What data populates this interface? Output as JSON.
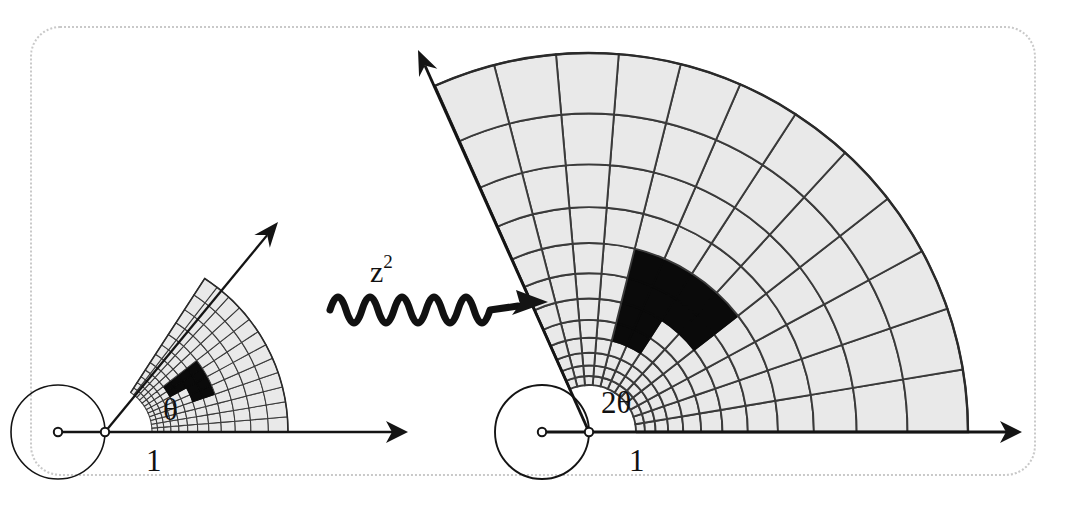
{
  "figure": {
    "background": "#ffffff",
    "frame": {
      "style": "dotted-rounded",
      "color": "#c9c9c9"
    },
    "colors": {
      "grid_fill": "#e9e9e9",
      "grid_stroke": "#3a3a3a",
      "shape_fill": "#0a0a0a",
      "axis": "#141414"
    }
  },
  "mapping": {
    "label_base": "z",
    "label_exponent": "2",
    "label_full": "z²",
    "arrow": "squiggly-right-arrow"
  },
  "domain_panel": {
    "name": "domain",
    "origin": [
      105,
      432
    ],
    "unit_radius": 47,
    "angle_label": "θ",
    "angle_degrees": 57,
    "unit_point_label": "1",
    "axis_arrow_tip": [
      408,
      432
    ],
    "ray_arrow_tip": [
      278,
      222
    ],
    "sector_outer_radius": 183,
    "radial_rings": 12,
    "angular_divisions": 12
  },
  "range_panel": {
    "name": "range",
    "origin": [
      589,
      432
    ],
    "unit_radius": 47,
    "angle_label": "2θ",
    "angle_degrees": 114,
    "unit_point_label": "1",
    "axis_arrow_tip": [
      1022,
      432
    ],
    "ray_arrow_tip": [
      418,
      50
    ],
    "sector_outer_radius": 379,
    "radial_rings": 6,
    "angular_divisions": 6
  },
  "chart_data": {
    "type": "diagram",
    "annotations": [
      "θ",
      "1",
      "z²",
      "2θ",
      "1"
    ],
    "domain_sector": {
      "r_min": 1.0,
      "r_max": 1.97,
      "theta_min_deg": 0,
      "theta_max_deg": 57,
      "radial_steps": 12,
      "angular_steps": 12,
      "radial_spacing": "geometric",
      "angular_spacing": "uniform"
    },
    "range_sector": {
      "r_min": 1.0,
      "r_max": 3.88,
      "theta_min_deg": 0,
      "theta_max_deg": 114,
      "radial_steps": 6,
      "angular_steps": 6,
      "radial_spacing": "geometric-squared",
      "angular_spacing": "uniform-doubled"
    },
    "marked_cells": [
      {
        "ring": 7,
        "sector": 5
      },
      {
        "ring": 7,
        "sector": 6
      },
      {
        "ring": 7,
        "sector": 7
      },
      {
        "ring": 7,
        "sector": 8
      },
      {
        "ring": 8,
        "sector": 5
      },
      {
        "ring": 8,
        "sector": 6
      },
      {
        "ring": 8,
        "sector": 7
      },
      {
        "ring": 8,
        "sector": 8
      },
      {
        "ring": 5,
        "sector": 7
      },
      {
        "ring": 6,
        "sector": 7
      },
      {
        "ring": 5,
        "sector": 8
      },
      {
        "ring": 6,
        "sector": 8
      }
    ],
    "legend": [],
    "grid": true
  }
}
